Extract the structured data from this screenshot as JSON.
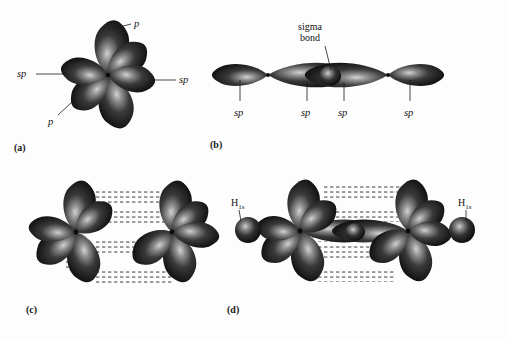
{
  "figure": {
    "background_color": "#fdfdfd",
    "lobe_color": "#2b2b2b",
    "lobe_highlight_color": "#bdbdbd",
    "hatch_color": "#8a8a8a"
  },
  "panels": [
    {
      "id": "a",
      "label": "(a)",
      "description": "Single carbon atom with two sp hybrid orbitals and two p orbitals",
      "annotations": [
        {
          "name": "p-upper",
          "text": "p",
          "italic": true
        },
        {
          "name": "p-lower",
          "text": "p",
          "italic": true
        },
        {
          "name": "sp-left",
          "text": "sp",
          "italic": true
        },
        {
          "name": "sp-right",
          "text": "sp",
          "italic": true
        }
      ]
    },
    {
      "id": "b",
      "label": "(b)",
      "description": "Two carbon atoms joined by a sigma bond formed from overlapping sp orbitals",
      "annotations": [
        {
          "name": "sigma-bond",
          "text": "sigma bond",
          "italic": false
        },
        {
          "name": "sp-1",
          "text": "sp",
          "italic": true
        },
        {
          "name": "sp-2",
          "text": "sp",
          "italic": true
        },
        {
          "name": "sp-3",
          "text": "sp",
          "italic": true
        },
        {
          "name": "sp-4",
          "text": "sp",
          "italic": true
        }
      ]
    },
    {
      "id": "c",
      "label": "(c)",
      "description": "Two carbon atoms with p orbitals overlapping side-on to form two pi bonds",
      "annotations": []
    },
    {
      "id": "d",
      "label": "(d)",
      "description": "Acetylene molecule with hydrogen 1s orbitals bonded to each carbon",
      "annotations": [
        {
          "name": "h1s-left",
          "text": "H",
          "subscript": "1s"
        },
        {
          "name": "h1s-right",
          "text": "H",
          "subscript": "1s"
        }
      ]
    }
  ],
  "labels": {
    "panel_a": "(a)",
    "panel_b": "(b)",
    "panel_c": "(c)",
    "panel_d": "(d)",
    "p": "p",
    "sp": "sp",
    "sigma_line1": "sigma",
    "sigma_line2": "bond",
    "h": "H",
    "h_sub": "1s"
  }
}
